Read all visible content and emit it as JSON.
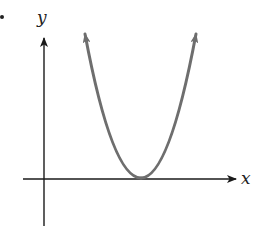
{
  "figure": {
    "type": "parabola-graph",
    "axes": {
      "x_label": "x",
      "y_label": "y"
    },
    "curve": {
      "shape": "parabola",
      "opens": "up",
      "vertex_on_x_axis": true,
      "vertex_x_sign": "positive",
      "color": "#6e6e6e"
    },
    "axis_color": "#1a1a1a"
  }
}
